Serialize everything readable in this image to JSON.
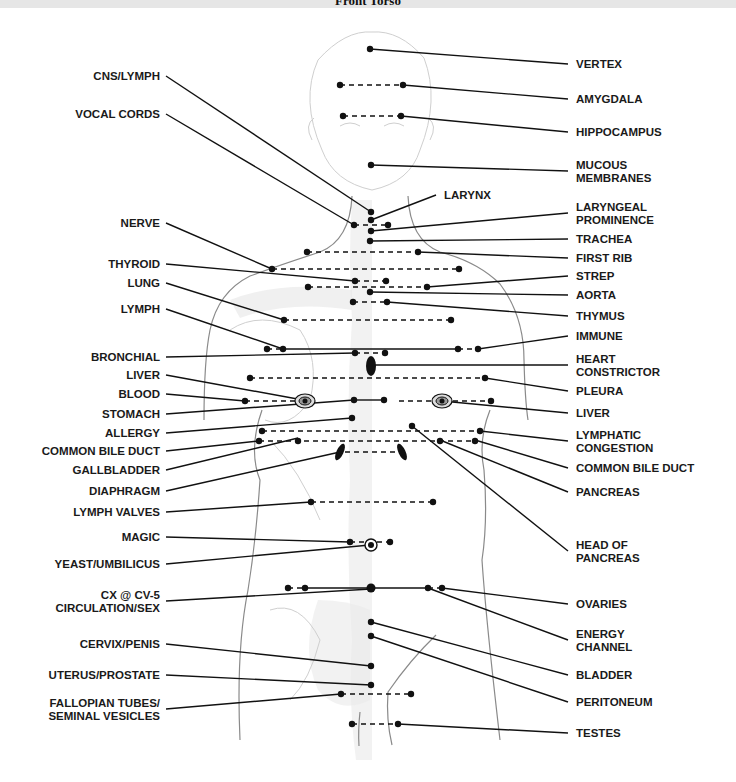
{
  "header": {
    "title": "Front Torso"
  },
  "diagram": {
    "left_labels": [
      {
        "id": "cns-lymph",
        "lines": [
          "CNS/LYMPH"
        ],
        "x": 160,
        "y": 80,
        "to": [
          371,
          212
        ]
      },
      {
        "id": "vocal-cords",
        "lines": [
          "VOCAL CORDS"
        ],
        "x": 160,
        "y": 118,
        "to": [
          354,
          225
        ]
      },
      {
        "id": "nerve",
        "lines": [
          "NERVE"
        ],
        "x": 160,
        "y": 227,
        "to": [
          272,
          269
        ]
      },
      {
        "id": "thyroid",
        "lines": [
          "THYROID"
        ],
        "x": 160,
        "y": 268,
        "to": [
          355,
          281
        ]
      },
      {
        "id": "lung",
        "lines": [
          "LUNG"
        ],
        "x": 160,
        "y": 287,
        "to": [
          284,
          320
        ]
      },
      {
        "id": "lymph",
        "lines": [
          "LYMPH"
        ],
        "x": 160,
        "y": 313,
        "to": [
          283,
          349
        ]
      },
      {
        "id": "bronchial",
        "lines": [
          "BRONCHIAL"
        ],
        "x": 160,
        "y": 361,
        "to": [
          355,
          353
        ]
      },
      {
        "id": "liver-left",
        "lines": [
          "LIVER"
        ],
        "x": 160,
        "y": 379,
        "to": [
          303,
          400
        ]
      },
      {
        "id": "blood",
        "lines": [
          "BLOOD"
        ],
        "x": 160,
        "y": 398,
        "to": [
          245,
          401
        ]
      },
      {
        "id": "stomach",
        "lines": [
          "STOMACH"
        ],
        "x": 160,
        "y": 418,
        "to": [
          354,
          400
        ]
      },
      {
        "id": "allergy",
        "lines": [
          "ALLERGY"
        ],
        "x": 160,
        "y": 437,
        "to": [
          352,
          418
        ]
      },
      {
        "id": "common-bile-duct-left",
        "lines": [
          "COMMON BILE DUCT"
        ],
        "x": 160,
        "y": 455,
        "to": [
          259,
          441
        ]
      },
      {
        "id": "gallbladder",
        "lines": [
          "GALLBLADDER"
        ],
        "x": 160,
        "y": 474,
        "to": [
          298,
          438
        ]
      },
      {
        "id": "diaphragm",
        "lines": [
          "DIAPHRAGM"
        ],
        "x": 160,
        "y": 495,
        "to": [
          340,
          452
        ]
      },
      {
        "id": "lymph-valves",
        "lines": [
          "LYMPH VALVES"
        ],
        "x": 160,
        "y": 516,
        "to": [
          311,
          502
        ]
      },
      {
        "id": "magic",
        "lines": [
          "MAGIC"
        ],
        "x": 160,
        "y": 541,
        "to": [
          350,
          542
        ]
      },
      {
        "id": "yeast-umbilicus",
        "lines": [
          "YEAST/UMBILICUS"
        ],
        "x": 160,
        "y": 568,
        "to": [
          370,
          545
        ]
      },
      {
        "id": "cx-cv5",
        "lines": [
          "CX @ CV-5",
          "CIRCULATION/SEX"
        ],
        "x": 160,
        "y": 605,
        "to": [
          371,
          589
        ]
      },
      {
        "id": "cervix-penis",
        "lines": [
          "CERVIX/PENIS"
        ],
        "x": 160,
        "y": 648,
        "to": [
          371,
          666
        ]
      },
      {
        "id": "uterus-prostate",
        "lines": [
          "UTERUS/PROSTATE"
        ],
        "x": 160,
        "y": 679,
        "to": [
          371,
          685
        ]
      },
      {
        "id": "fallopian-tubes",
        "lines": [
          "FALLOPIAN TUBES/",
          "SEMINAL VESICLES"
        ],
        "x": 160,
        "y": 713,
        "to": [
          341,
          694
        ]
      }
    ],
    "right_labels": [
      {
        "id": "vertex",
        "lines": [
          "VERTEX"
        ],
        "x": 574,
        "y": 68,
        "to": [
          370,
          49
        ]
      },
      {
        "id": "amygdala",
        "lines": [
          "AMYGDALA"
        ],
        "x": 574,
        "y": 103,
        "to": [
          403,
          85
        ]
      },
      {
        "id": "hippocampus",
        "lines": [
          "HIPPOCAMPUS"
        ],
        "x": 574,
        "y": 136,
        "to": [
          401,
          116
        ]
      },
      {
        "id": "mucous-membranes",
        "lines": [
          "MUCOUS",
          "MEMBRANES"
        ],
        "x": 574,
        "y": 175,
        "to": [
          371,
          165
        ]
      },
      {
        "id": "larynx",
        "lines": [
          "LARYNX"
        ],
        "x": 442,
        "y": 199,
        "to": [
          371,
          220
        ]
      },
      {
        "id": "laryngeal-prominence",
        "lines": [
          "LARYNGEAL",
          "PROMINENCE"
        ],
        "x": 574,
        "y": 217,
        "to": [
          371,
          231
        ]
      },
      {
        "id": "trachea",
        "lines": [
          "TRACHEA"
        ],
        "x": 574,
        "y": 243,
        "to": [
          370,
          241
        ]
      },
      {
        "id": "first-rib",
        "lines": [
          "FIRST RIB"
        ],
        "x": 574,
        "y": 262,
        "to": [
          418,
          252
        ]
      },
      {
        "id": "strep",
        "lines": [
          "STREP"
        ],
        "x": 574,
        "y": 280,
        "to": [
          427,
          287
        ]
      },
      {
        "id": "aorta",
        "lines": [
          "AORTA"
        ],
        "x": 574,
        "y": 299,
        "to": [
          370,
          292
        ]
      },
      {
        "id": "thymus",
        "lines": [
          "THYMUS"
        ],
        "x": 574,
        "y": 320,
        "to": [
          387,
          302
        ]
      },
      {
        "id": "immune",
        "lines": [
          "IMMUNE"
        ],
        "x": 574,
        "y": 340,
        "to": [
          478,
          349
        ]
      },
      {
        "id": "heart-constrictor",
        "lines": [
          "HEART",
          "CONSTRICTOR"
        ],
        "x": 574,
        "y": 369,
        "to": [
          373,
          365
        ]
      },
      {
        "id": "pleura",
        "lines": [
          "PLEURA"
        ],
        "x": 574,
        "y": 395,
        "to": [
          485,
          378
        ]
      },
      {
        "id": "liver-right",
        "lines": [
          "LIVER"
        ],
        "x": 574,
        "y": 417,
        "to": [
          442,
          401
        ]
      },
      {
        "id": "lymphatic-congestion",
        "lines": [
          "LYMPHATIC",
          "CONGESTION"
        ],
        "x": 574,
        "y": 445,
        "to": [
          480,
          431
        ]
      },
      {
        "id": "common-bile-duct-right",
        "lines": [
          "COMMON BILE DUCT"
        ],
        "x": 574,
        "y": 472,
        "to": [
          475,
          440
        ]
      },
      {
        "id": "pancreas",
        "lines": [
          "PANCREAS"
        ],
        "x": 574,
        "y": 496,
        "to": [
          440,
          440
        ]
      },
      {
        "id": "head-of-pancreas",
        "lines": [
          "HEAD OF",
          "PANCREAS"
        ],
        "x": 574,
        "y": 555,
        "to": [
          412,
          426
        ]
      },
      {
        "id": "ovaries",
        "lines": [
          "OVARIES"
        ],
        "x": 574,
        "y": 608,
        "to": [
          442,
          588
        ]
      },
      {
        "id": "energy-channel",
        "lines": [
          "ENERGY",
          "CHANNEL"
        ],
        "x": 574,
        "y": 644,
        "to": [
          428,
          588
        ]
      },
      {
        "id": "bladder",
        "lines": [
          "BLADDER"
        ],
        "x": 574,
        "y": 679,
        "to": [
          371,
          622
        ]
      },
      {
        "id": "peritoneum",
        "lines": [
          "PERITONEUM"
        ],
        "x": 574,
        "y": 706,
        "to": [
          371,
          636
        ]
      },
      {
        "id": "testes",
        "lines": [
          "TESTES"
        ],
        "x": 574,
        "y": 737,
        "to": [
          398,
          724
        ]
      }
    ],
    "dashed_pairs": [
      [
        [
          340,
          85
        ],
        [
          403,
          85
        ]
      ],
      [
        [
          343,
          116
        ],
        [
          401,
          116
        ]
      ],
      [
        [
          354,
          225
        ],
        [
          388,
          225
        ]
      ],
      [
        [
          307,
          252
        ],
        [
          418,
          252
        ]
      ],
      [
        [
          272,
          269
        ],
        [
          459,
          269
        ]
      ],
      [
        [
          355,
          281
        ],
        [
          386,
          281
        ]
      ],
      [
        [
          308,
          287
        ],
        [
          427,
          287
        ]
      ],
      [
        [
          353,
          302
        ],
        [
          387,
          302
        ]
      ],
      [
        [
          284,
          320
        ],
        [
          451,
          320
        ]
      ],
      [
        [
          267,
          349
        ],
        [
          283,
          349
        ]
      ],
      [
        [
          458,
          349
        ],
        [
          478,
          349
        ]
      ],
      [
        [
          355,
          353
        ],
        [
          385,
          353
        ]
      ],
      [
        [
          250,
          378
        ],
        [
          485,
          378
        ]
      ],
      [
        [
          245,
          401
        ],
        [
          303,
          401
        ]
      ],
      [
        [
          399,
          401
        ],
        [
          491,
          401
        ]
      ],
      [
        [
          262,
          431
        ],
        [
          480,
          431
        ]
      ],
      [
        [
          259,
          441
        ],
        [
          475,
          441
        ]
      ],
      [
        [
          345,
          452
        ],
        [
          400,
          452
        ]
      ],
      [
        [
          311,
          502
        ],
        [
          433,
          502
        ]
      ],
      [
        [
          350,
          542
        ],
        [
          390,
          542
        ]
      ],
      [
        [
          288,
          588
        ],
        [
          305,
          588
        ]
      ],
      [
        [
          428,
          588
        ],
        [
          442,
          588
        ]
      ],
      [
        [
          341,
          694
        ],
        [
          411,
          694
        ]
      ],
      [
        [
          352,
          724
        ],
        [
          398,
          724
        ]
      ]
    ],
    "solid_segments": [
      [
        [
          283,
          349
        ],
        [
          458,
          349
        ]
      ],
      [
        [
          354,
          400
        ],
        [
          384,
          400
        ]
      ],
      [
        [
          305,
          588
        ],
        [
          428,
          588
        ]
      ]
    ],
    "dots": [
      [
        370,
        49
      ],
      [
        340,
        85
      ],
      [
        403,
        85
      ],
      [
        343,
        116
      ],
      [
        401,
        116
      ],
      [
        371,
        165
      ],
      [
        371,
        212
      ],
      [
        371,
        220
      ],
      [
        354,
        225
      ],
      [
        388,
        225
      ],
      [
        371,
        231
      ],
      [
        370,
        241
      ],
      [
        307,
        252
      ],
      [
        418,
        252
      ],
      [
        272,
        269
      ],
      [
        459,
        269
      ],
      [
        355,
        281
      ],
      [
        386,
        281
      ],
      [
        308,
        287
      ],
      [
        427,
        287
      ],
      [
        370,
        292
      ],
      [
        353,
        302
      ],
      [
        387,
        302
      ],
      [
        284,
        320
      ],
      [
        451,
        320
      ],
      [
        267,
        349
      ],
      [
        283,
        349
      ],
      [
        458,
        349
      ],
      [
        478,
        349
      ],
      [
        355,
        353
      ],
      [
        385,
        353
      ],
      [
        250,
        378
      ],
      [
        485,
        378
      ],
      [
        245,
        401
      ],
      [
        354,
        400
      ],
      [
        384,
        400
      ],
      [
        491,
        401
      ],
      [
        352,
        418
      ],
      [
        412,
        426
      ],
      [
        262,
        431
      ],
      [
        480,
        431
      ],
      [
        259,
        441
      ],
      [
        298,
        441
      ],
      [
        440,
        441
      ],
      [
        475,
        441
      ],
      [
        311,
        502
      ],
      [
        433,
        502
      ],
      [
        350,
        542
      ],
      [
        390,
        542
      ],
      [
        288,
        588
      ],
      [
        305,
        588
      ],
      [
        428,
        588
      ],
      [
        442,
        588
      ],
      [
        371,
        622
      ],
      [
        371,
        636
      ],
      [
        371,
        666
      ],
      [
        371,
        685
      ],
      [
        341,
        694
      ],
      [
        411,
        694
      ],
      [
        352,
        724
      ],
      [
        398,
        724
      ]
    ],
    "big_dots": [
      [
        371,
        588
      ]
    ],
    "target_marks": [
      [
        305,
        401
      ],
      [
        442,
        401
      ]
    ],
    "ring_marks": [
      [
        371,
        545
      ]
    ],
    "oval_marks": [
      {
        "cx": 371,
        "cy": 366,
        "rx": 5,
        "ry": 10,
        "rot": 0
      },
      {
        "cx": 340,
        "cy": 452,
        "rx": 3.5,
        "ry": 9,
        "rot": 25
      },
      {
        "cx": 402,
        "cy": 452,
        "rx": 3.5,
        "ry": 9,
        "rot": -25
      }
    ]
  }
}
